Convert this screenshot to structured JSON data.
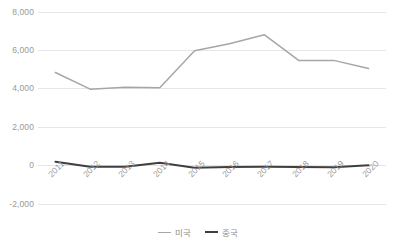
{
  "chart_data": {
    "type": "line",
    "title": "",
    "xlabel": "",
    "ylabel": "",
    "categories": [
      "2011",
      "2012",
      "2013",
      "2014",
      "2015",
      "2016",
      "2017",
      "2018",
      "2019",
      "2020"
    ],
    "series": [
      {
        "name": "미국",
        "color": "#a6a6a6",
        "values": [
          4850,
          3980,
          4080,
          4060,
          5980,
          6350,
          6820,
          5470,
          5480,
          5060
        ]
      },
      {
        "name": "중국",
        "color": "#3f3f3f",
        "values": [
          200,
          -60,
          -60,
          150,
          -110,
          -70,
          -60,
          -70,
          -90,
          20
        ]
      }
    ],
    "ylim": [
      -2000,
      8000
    ],
    "y_ticks": [
      8000,
      6000,
      4000,
      2000,
      0,
      -2000
    ],
    "y_tick_labels": [
      "8,000",
      "6,000",
      "4,000",
      "2,000",
      "0",
      "-2,000"
    ],
    "grid": true,
    "grid_axis": "y",
    "legend_position": "bottom",
    "axis_label_rotation": -45,
    "colors": {
      "grid": "#e6e6e6",
      "tick_text": "#9a9a9a",
      "legend_text": "#8f8f8f",
      "background": "#ffffff"
    }
  }
}
